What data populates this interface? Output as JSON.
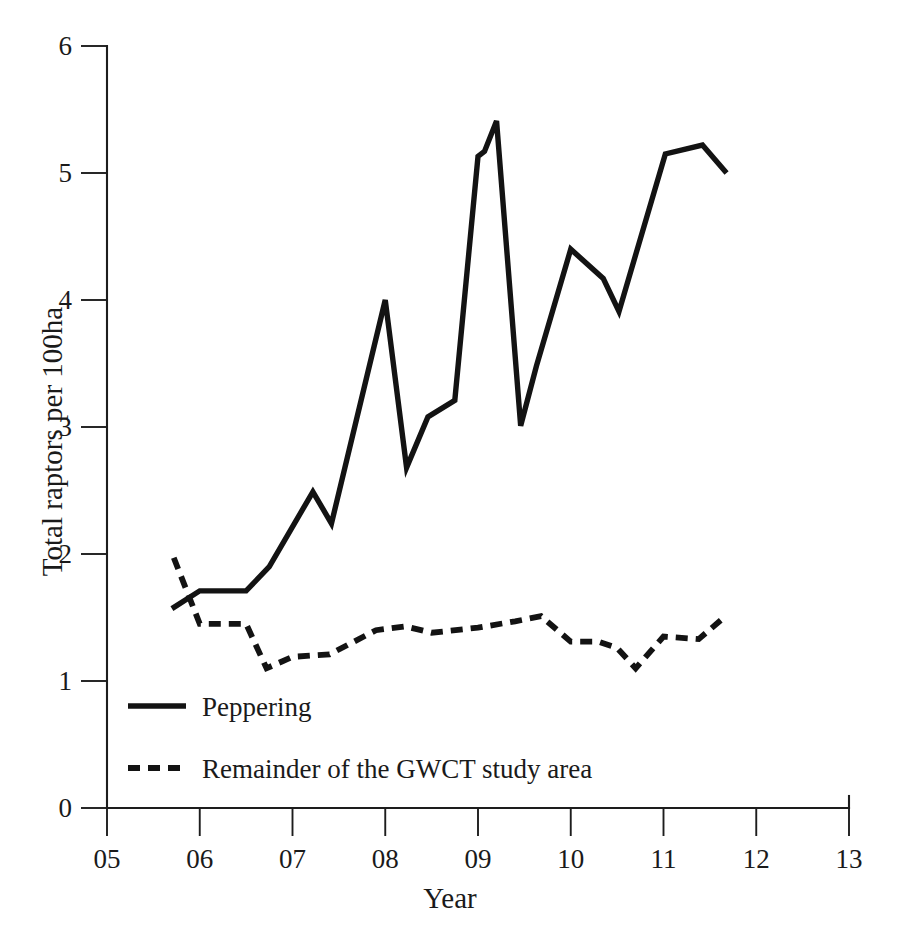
{
  "chart_data": {
    "type": "line",
    "title": "",
    "xlabel": "Year",
    "ylabel": "Total raptors per 100ha",
    "xlim": [
      5,
      13
    ],
    "ylim": [
      0,
      6
    ],
    "grid": false,
    "legend_position": "inside-bottom-left",
    "x_tick_labels": [
      "05",
      "06",
      "07",
      "08",
      "09",
      "10",
      "11",
      "12",
      "13"
    ],
    "x_tick_values": [
      5,
      6,
      7,
      8,
      9,
      10,
      11,
      12,
      13
    ],
    "y_tick_labels": [
      "0",
      "1",
      "2",
      "3",
      "4",
      "5",
      "6"
    ],
    "y_tick_values": [
      0,
      1,
      2,
      3,
      4,
      5,
      6
    ],
    "series": [
      {
        "name": "Peppering",
        "style": "solid",
        "color": "#131313",
        "x": [
          5.7,
          6.0,
          6.5,
          6.75,
          7.22,
          7.42,
          8.0,
          8.23,
          8.46,
          8.75,
          9.0,
          9.07,
          9.2,
          9.46,
          9.63,
          10.0,
          10.35,
          10.52,
          11.02,
          11.42,
          11.68
        ],
        "values": [
          1.57,
          1.71,
          1.71,
          1.9,
          2.49,
          2.24,
          4.0,
          2.68,
          3.08,
          3.21,
          5.13,
          5.17,
          5.41,
          3.01,
          3.48,
          4.4,
          4.17,
          3.91,
          5.15,
          5.22,
          5.0
        ]
      },
      {
        "name": "Remainder of the GWCT study area",
        "style": "dashed",
        "color": "#131313",
        "x": [
          5.72,
          6.0,
          6.5,
          6.72,
          7.0,
          7.4,
          7.9,
          8.22,
          8.5,
          9.0,
          9.4,
          9.68,
          10.0,
          10.3,
          10.5,
          10.7,
          11.0,
          11.38,
          11.62
        ],
        "values": [
          1.97,
          1.45,
          1.45,
          1.1,
          1.19,
          1.21,
          1.4,
          1.43,
          1.38,
          1.42,
          1.47,
          1.51,
          1.31,
          1.31,
          1.26,
          1.1,
          1.35,
          1.33,
          1.48
        ]
      }
    ],
    "legend_entries": [
      {
        "label": "Peppering",
        "style": "solid"
      },
      {
        "label": "Remainder of the GWCT study area",
        "style": "dashed"
      }
    ]
  },
  "axes": {
    "y_title": "Total raptors per 100ha",
    "x_title": "Year",
    "y_ticks": [
      {
        "label": "6"
      },
      {
        "label": "5"
      },
      {
        "label": "4"
      },
      {
        "label": "3"
      },
      {
        "label": "2"
      },
      {
        "label": "1"
      },
      {
        "label": "0"
      }
    ],
    "x_ticks": [
      {
        "label": "05"
      },
      {
        "label": "06"
      },
      {
        "label": "07"
      },
      {
        "label": "08"
      },
      {
        "label": "09"
      },
      {
        "label": "10"
      },
      {
        "label": "11"
      },
      {
        "label": "12"
      },
      {
        "label": "13"
      }
    ]
  },
  "legend": {
    "peppering_label": "Peppering",
    "remainder_label": "Remainder of the GWCT study area"
  },
  "caption": {
    "text": ""
  },
  "colors": {
    "ink": "#131313",
    "axis": "#1d1d1d",
    "background": "#ffffff"
  }
}
